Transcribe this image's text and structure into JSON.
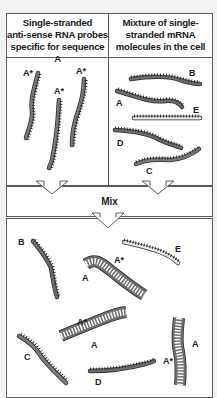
{
  "left_panel": {
    "title_lines": [
      "Single-stranded",
      "anti-sense RNA probes",
      "specific for sequence A"
    ],
    "probe_labels": [
      "A*",
      "A*",
      "A*"
    ]
  },
  "right_panel": {
    "title_lines": [
      "Mixture of single-",
      "stranded mRNA",
      "molecules in the cell"
    ],
    "molecule_labels": [
      "B",
      "A",
      "E",
      "D",
      "C"
    ]
  },
  "mix_box": {
    "label": "Mix"
  },
  "result_panel": {
    "labels": {
      "b": "B",
      "e": "E",
      "c": "C",
      "d": "D",
      "hybrid1_probe": "A*",
      "hybrid1_target": "A",
      "hybrid2_probe": "A*",
      "hybrid2_target": "A",
      "hybrid3_probe": "A*",
      "hybrid3_target": "A"
    }
  },
  "colors": {
    "strand_dark": "#6e6e6e",
    "strand_light": "#e6e6e6",
    "strand_outline": "#2a2a2a",
    "border": "#5a5a5a",
    "background": "#f2f2f2",
    "panel": "#ffffff"
  }
}
